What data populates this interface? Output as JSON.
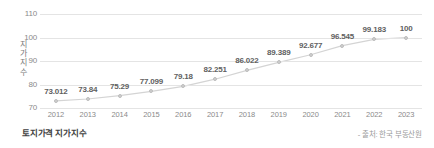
{
  "chart_data": {
    "type": "line",
    "title": "토지가격 지가지수",
    "xlabel": "",
    "ylabel": "지가지수",
    "ylim": [
      70,
      110
    ],
    "yticks": [
      70,
      80,
      90,
      100,
      110
    ],
    "grid": true,
    "legend": "none",
    "categories": [
      "2012",
      "2013",
      "2014",
      "2015",
      "2016",
      "2017",
      "2018",
      "2019",
      "2020",
      "2021",
      "2022",
      "2023"
    ],
    "values": [
      73.012,
      73.84,
      75.29,
      77.099,
      79.18,
      82.251,
      86.022,
      89.389,
      92.677,
      96.545,
      99.183,
      100
    ],
    "point_labels": [
      "73.012",
      "73.84",
      "75.29",
      "77.099",
      "79.18",
      "82.251",
      "86.022",
      "89.389",
      "92.677",
      "96.545",
      "99.183",
      "100"
    ],
    "series": [
      {
        "name": "지가지수",
        "values": [
          73.012,
          73.84,
          75.29,
          77.099,
          79.18,
          82.251,
          86.022,
          89.389,
          92.677,
          96.545,
          99.183,
          100
        ]
      }
    ],
    "colors": {
      "line": "#d4d4d4",
      "marker": "#cfcfcf",
      "grid": "#e4e4e4",
      "label_text": "#5f5f5f",
      "axis_text": "#8a8a8a"
    }
  },
  "footer": {
    "title": "토지가격 지가지수",
    "source": "- 출처: 한국 부동산원"
  },
  "y_axis_title_chars": [
    "지",
    "가",
    "지",
    "수"
  ]
}
